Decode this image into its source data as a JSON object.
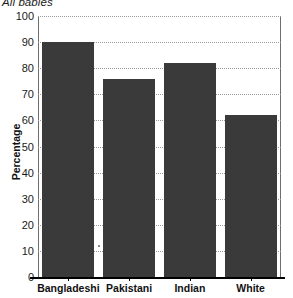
{
  "chart_data": {
    "type": "bar",
    "title": "All babies",
    "xlabel": "",
    "ylabel": "Percentage",
    "categories": [
      "Bangladeshi",
      "Pakistani",
      "Indian",
      "White"
    ],
    "values": [
      90,
      76,
      82,
      62
    ],
    "ylim": [
      0,
      100
    ],
    "ytick_values": [
      0,
      10,
      20,
      30,
      40,
      50,
      60,
      70,
      80,
      90,
      100
    ],
    "ytick_labels": [
      "0",
      "10",
      "20",
      "30",
      "40",
      "50",
      "60",
      "70",
      "80",
      "90",
      "100"
    ],
    "grid": "horizontal-dotted",
    "legend": null,
    "bar_color": "#3a3a3a",
    "gridline_color": "#9a9a9a",
    "axis_color": "#000000",
    "background_color": "#ffffff"
  }
}
